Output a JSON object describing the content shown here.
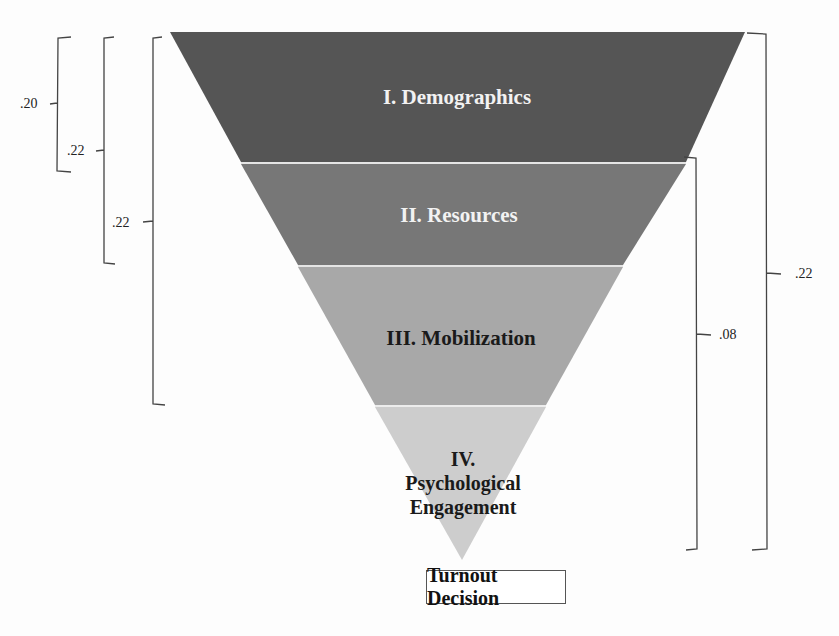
{
  "diagram": {
    "type": "inverted-funnel",
    "bands": [
      {
        "label": "I. Demographics",
        "color": "#555555",
        "text_color": "#f2f2f2"
      },
      {
        "label": "II. Resources",
        "color": "#777777",
        "text_color": "#f2f2f2"
      },
      {
        "label": "III. Mobilization",
        "color": "#a8a8a8",
        "text_color": "#1a1a1a"
      },
      {
        "label_lines": [
          "IV.",
          "Psychological",
          "Engagement"
        ],
        "color": "#cdcdcd",
        "text_color": "#1a1a1a"
      }
    ],
    "outcome": "Turnout Decision",
    "left_brackets": [
      {
        "value": ".20",
        "spans": "I"
      },
      {
        "value": ".22",
        "spans": "I–II"
      },
      {
        "value": ".22",
        "spans": "I–III"
      }
    ],
    "right_brackets": [
      {
        "value": ".08",
        "spans": "II–IV"
      },
      {
        "value": ".22",
        "spans": "I–IV"
      }
    ]
  }
}
